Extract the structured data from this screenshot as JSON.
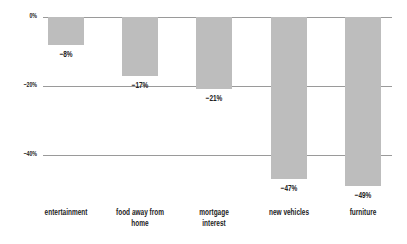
{
  "chart_data": {
    "type": "bar",
    "title": "",
    "xlabel": "",
    "ylabel": "",
    "categories": [
      "entertainment",
      "food away from home",
      "mortgage interest",
      "new vehicles",
      "furniture"
    ],
    "category_lines": [
      [
        "entertainment"
      ],
      [
        "food away from",
        "home"
      ],
      [
        "mortgage",
        "interest"
      ],
      [
        "new vehicles"
      ],
      [
        "furniture"
      ]
    ],
    "values": [
      -8,
      -17,
      -21,
      -47,
      -49
    ],
    "value_labels": [
      "−8%",
      "−17%",
      "−21%",
      "−47%",
      "−49%"
    ],
    "yticks": [
      0,
      -20,
      -40
    ],
    "ytick_labels": [
      "0%",
      "−20%",
      "−40%"
    ],
    "ylim": [
      -50,
      0
    ],
    "grid": true,
    "legend": null,
    "bar_color": "#bdbdbd",
    "grid_color": "#9a9a9a"
  }
}
